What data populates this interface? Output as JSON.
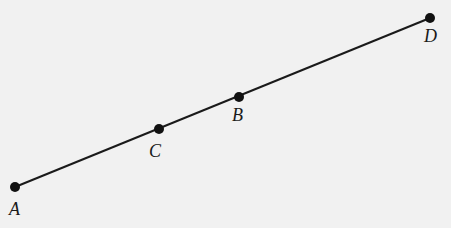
{
  "diagram": {
    "type": "line-segment-with-points",
    "segment": {
      "from": "A",
      "to": "D",
      "color": "#1a1a1a"
    },
    "points": [
      {
        "id": "A",
        "label": "A",
        "x": 15,
        "y": 187,
        "label_x": 9,
        "label_y": 200
      },
      {
        "id": "C",
        "label": "C",
        "x": 159,
        "y": 129,
        "label_x": 149,
        "label_y": 142
      },
      {
        "id": "B",
        "label": "B",
        "x": 239,
        "y": 97,
        "label_x": 232,
        "label_y": 106
      },
      {
        "id": "D",
        "label": "D",
        "x": 430,
        "y": 18,
        "label_x": 424,
        "label_y": 27
      }
    ],
    "order_along_line": [
      "A",
      "C",
      "B",
      "D"
    ],
    "background": "#f1f1f1"
  }
}
